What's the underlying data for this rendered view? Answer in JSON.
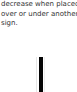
{
  "text": {
    "lines": [
      "decrease when placed",
      "over or under another",
      "sign."
    ]
  },
  "figure": {
    "shape": "vertical-bar",
    "color": "#050505"
  }
}
